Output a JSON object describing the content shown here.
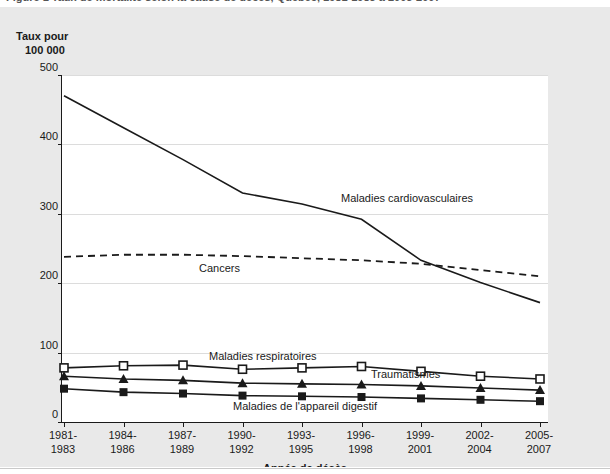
{
  "figure": {
    "cut_caption": "Figure 1  Taux de mortalité selon la cause de décès, Québec, 1981-1983 à 2005-2007",
    "y_axis_title_line1": "Taux pour",
    "y_axis_title_line2": "100 000",
    "x_axis_title": "Année de décès"
  },
  "chart_data": {
    "type": "line",
    "title": "",
    "xlabel": "Année de décès",
    "ylabel": "Taux pour 100 000",
    "ylim": [
      0,
      500
    ],
    "yticks": [
      0,
      100,
      200,
      300,
      400,
      500
    ],
    "grid": true,
    "legend_position": "inline-annotations",
    "categories": [
      "1981-1983",
      "1984-1986",
      "1987-1989",
      "1990-1992",
      "1993-1995",
      "1996-1998",
      "1999-2001",
      "2002-2004",
      "2005-2007"
    ],
    "series": [
      {
        "name": "Maladies cardiovasculaires",
        "style": "solid",
        "marker": "none",
        "color": "#1a1a1a",
        "values": [
          470,
          424,
          378,
          330,
          314,
          292,
          233,
          201,
          172
        ]
      },
      {
        "name": "Cancers",
        "style": "dashed",
        "marker": "none",
        "color": "#1a1a1a",
        "values": [
          238,
          241,
          241,
          239,
          236,
          233,
          228,
          219,
          210
        ]
      },
      {
        "name": "Maladies respiratoires",
        "style": "solid",
        "marker": "open-square",
        "color": "#1a1a1a",
        "values": [
          78,
          81,
          82,
          76,
          78,
          80,
          73,
          66,
          62
        ]
      },
      {
        "name": "Traumatismes",
        "style": "solid",
        "marker": "filled-triangle",
        "color": "#1a1a1a",
        "values": [
          66,
          62,
          60,
          56,
          55,
          54,
          52,
          49,
          46
        ]
      },
      {
        "name": "Maladies de l'appareil digestif",
        "style": "solid",
        "marker": "filled-square",
        "color": "#1a1a1a",
        "values": [
          48,
          43,
          41,
          38,
          37,
          36,
          34,
          32,
          30
        ]
      }
    ],
    "annotations": [
      {
        "text": "Maladies cardiovasculaires",
        "x_px": 340,
        "y_px": 192
      },
      {
        "text": "Cancers",
        "x_px": 198,
        "y_px": 262
      },
      {
        "text": "Maladies respiratoires",
        "x_px": 208,
        "y_px": 350
      },
      {
        "text": "Traumatismes",
        "x_px": 370,
        "y_px": 368
      },
      {
        "text": "Maladies de l'appareil digestif",
        "x_px": 232,
        "y_px": 400
      }
    ]
  },
  "colors": {
    "page_background": "#e9e9e9",
    "plot_background": "#ffffff",
    "axis": "#1a1a1a",
    "grid": "#dcdcdc",
    "series": "#1a1a1a"
  }
}
